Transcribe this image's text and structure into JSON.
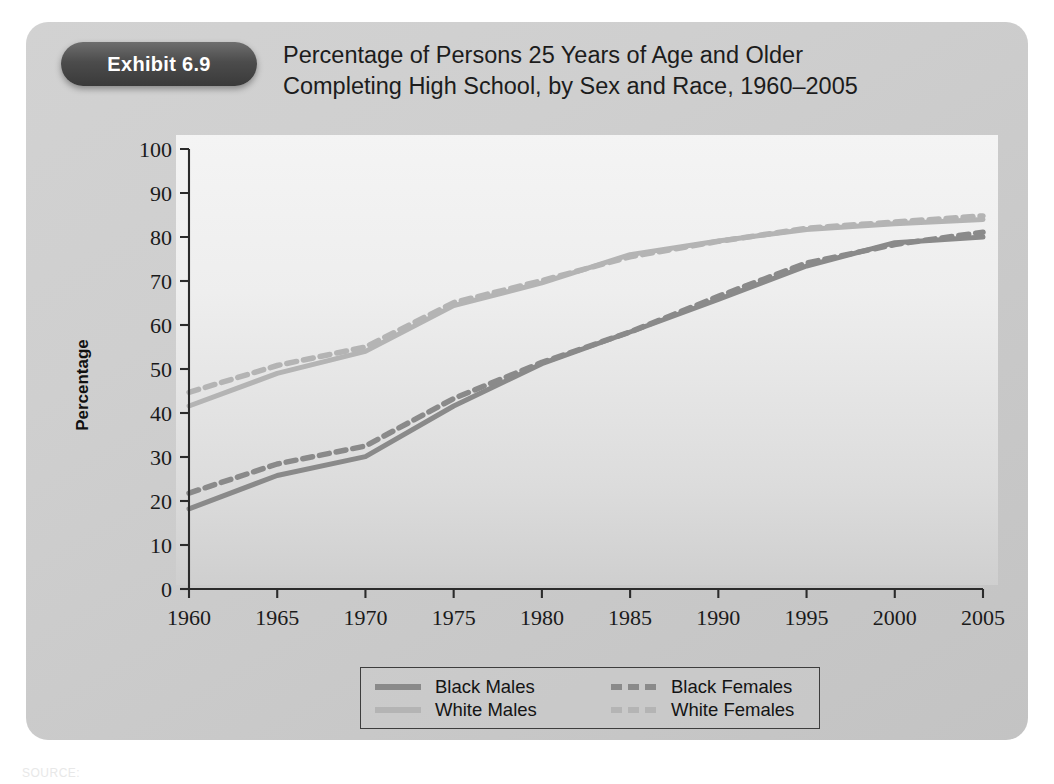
{
  "exhibit": {
    "badge_label": "Exhibit 6.9",
    "title_line1": "Percentage of Persons 25 Years of Age and Older",
    "title_line2": "Completing High School, by Sex and Race, 1960–2005"
  },
  "source_note": "SOURCE:",
  "colors": {
    "card_background": "#cfcfcf",
    "plot_background": "#efefef",
    "badge_background": "#4c4c4c",
    "axis": "#2b2b2b",
    "black_series": "#8a8a8a",
    "white_series": "#b4b4b4"
  },
  "legend": {
    "items": [
      {
        "label": "Black Males",
        "style": "solid",
        "swatch": "sw-solid-dark"
      },
      {
        "label": "Black Females",
        "style": "dashed",
        "swatch": "sw-dash-dark"
      },
      {
        "label": "White Males",
        "style": "solid",
        "swatch": "sw-solid-light"
      },
      {
        "label": "White Females",
        "style": "dashed",
        "swatch": "sw-dash-light"
      }
    ]
  },
  "chart_data": {
    "type": "line",
    "title": "Percentage of Persons 25 Years of Age and Older Completing High School, by Sex and Race, 1960–2005",
    "xlabel": "",
    "ylabel": "Percentage",
    "xlim": [
      1960,
      2005
    ],
    "ylim": [
      0,
      100
    ],
    "ytick_labels": [
      "0",
      "10",
      "20",
      "30",
      "40",
      "50",
      "60",
      "70",
      "80",
      "90",
      "100"
    ],
    "yticks": [
      0,
      10,
      20,
      30,
      40,
      50,
      60,
      70,
      80,
      90,
      100
    ],
    "xtick_labels": [
      "1960",
      "1965",
      "1970",
      "1975",
      "1980",
      "1985",
      "1990",
      "1995",
      "2000",
      "2005"
    ],
    "xticks": [
      1960,
      1965,
      1970,
      1975,
      1980,
      1985,
      1990,
      1995,
      2000,
      2005
    ],
    "grid": false,
    "legend_position": "bottom",
    "x": [
      1960,
      1965,
      1970,
      1975,
      1980,
      1985,
      1990,
      1995,
      2000,
      2005
    ],
    "series": [
      {
        "name": "White Males",
        "style": "solid",
        "color": "#b4b4b4",
        "values": [
          41.6,
          49.0,
          54.0,
          64.4,
          69.6,
          76.0,
          79.1,
          81.7,
          83.0,
          84.0
        ]
      },
      {
        "name": "White Females",
        "style": "dashed",
        "color": "#b4b4b4",
        "values": [
          44.7,
          50.8,
          55.0,
          65.1,
          70.1,
          75.5,
          79.0,
          82.0,
          83.4,
          84.8
        ]
      },
      {
        "name": "Black Males",
        "style": "solid",
        "color": "#8a8a8a",
        "values": [
          18.2,
          25.8,
          30.1,
          41.6,
          51.2,
          58.4,
          65.8,
          73.4,
          78.7,
          80.0
        ]
      },
      {
        "name": "Black Females",
        "style": "dashed",
        "color": "#8a8a8a",
        "values": [
          21.8,
          28.4,
          32.5,
          43.3,
          51.5,
          58.4,
          66.5,
          74.1,
          78.3,
          81.1
        ]
      }
    ]
  }
}
